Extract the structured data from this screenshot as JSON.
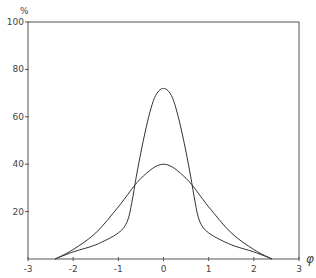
{
  "chart_data": {
    "type": "line",
    "title": "",
    "xlabel": "φ",
    "ylabel": "%",
    "xlim": [
      -3,
      3
    ],
    "ylim": [
      0,
      100
    ],
    "grid": false,
    "legend": null,
    "x_ticks": [
      "-3",
      "-2",
      "-1",
      "0",
      "1",
      "2",
      "3"
    ],
    "y_ticks": [
      "20",
      "40",
      "60",
      "80",
      "100"
    ],
    "series": [
      {
        "name": "narrow distribution",
        "x": [
          -2.4,
          -2.0,
          -1.5,
          -1.0,
          -0.8,
          -0.7,
          -0.6,
          -0.5,
          -0.4,
          -0.3,
          -0.2,
          -0.1,
          0,
          0.1,
          0.2,
          0.3,
          0.4,
          0.5,
          0.6,
          0.7,
          0.8,
          1.0,
          1.5,
          2.0,
          2.4
        ],
        "y": [
          0,
          3,
          6,
          11,
          16,
          24,
          35,
          45,
          54,
          62,
          68,
          71,
          72,
          71,
          68,
          62,
          54,
          45,
          35,
          24,
          16,
          11,
          6,
          3,
          0
        ]
      },
      {
        "name": "wide distribution",
        "x": [
          -2.4,
          -2.0,
          -1.5,
          -1.0,
          -0.5,
          0,
          0.5,
          1.0,
          1.5,
          2.0,
          2.4
        ],
        "y": [
          0,
          4,
          11,
          22,
          34,
          40,
          34,
          22,
          11,
          4,
          0
        ]
      }
    ]
  },
  "labels": {
    "y_unit": "%",
    "x_symbol": "φ"
  }
}
